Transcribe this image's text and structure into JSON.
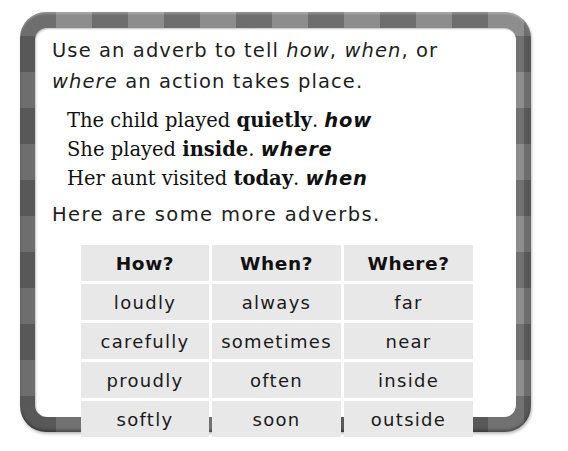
{
  "intro": {
    "part1": "Use an adverb to tell ",
    "how": "how",
    "comma1": ", ",
    "when": "when",
    "part2": ", or",
    "where": "where",
    "part3": " an action takes place."
  },
  "examples": [
    {
      "before": "The child played ",
      "adverb": "quietly",
      "after": ". ",
      "tag": "how"
    },
    {
      "before": "She played ",
      "adverb": "inside",
      "after": ". ",
      "tag": "where"
    },
    {
      "before": "Her aunt visited ",
      "adverb": "today",
      "after": ". ",
      "tag": "when"
    }
  ],
  "lead": "Here are some more adverbs.",
  "table": {
    "headers": [
      "How?",
      "When?",
      "Where?"
    ],
    "rows": [
      [
        "loudly",
        "always",
        "far"
      ],
      [
        "carefully",
        "sometimes",
        "near"
      ],
      [
        "proudly",
        "often",
        "inside"
      ],
      [
        "softly",
        "soon",
        "outside"
      ]
    ]
  },
  "colors": {
    "frame": "#8d8d8d",
    "cell_background": "#e8e8e8",
    "text": "#1a1a1a"
  }
}
